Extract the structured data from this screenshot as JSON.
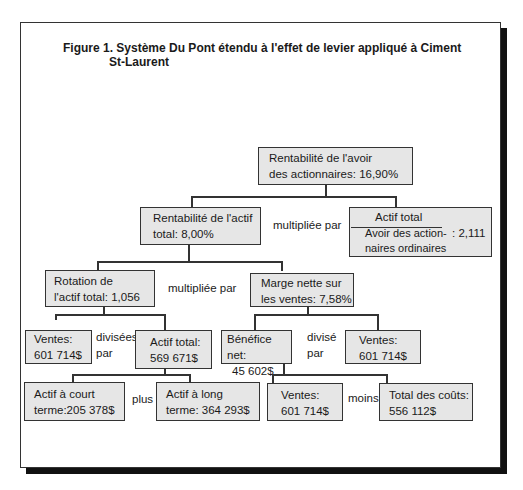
{
  "figure": {
    "title_line1": "Figure 1. Système Du Pont étendu à l'effet de levier appliqué à Ciment",
    "title_line2": "St-Laurent"
  },
  "nodes": {
    "roe": {
      "line1": "Rentabilité de l'avoir",
      "line2": "des actionnaires: 16,90%"
    },
    "roa": {
      "line1": "Rentabilité de l'actif",
      "line2": "total: 8,00%"
    },
    "leverage": {
      "numerator": "Actif total",
      "denominator_line1": "Avoir des action-",
      "denominator_line2": "naires ordinaires",
      "value": ": 2,111"
    },
    "turnover": {
      "line1": "Rotation de",
      "line2": "l'actif total: 1,056"
    },
    "margin": {
      "line1": "Marge nette sur",
      "line2": "les ventes: 7,58%"
    },
    "sales_a": {
      "line1": "Ventes:",
      "line2": "601 714$"
    },
    "total_assets": {
      "line1": "Actif total:",
      "line2": "569 671$"
    },
    "net_income": {
      "line1": "Bénéfice net:",
      "line2": "45 602$"
    },
    "sales_b": {
      "line1": "Ventes:",
      "line2": "601 714$"
    },
    "current_assets": {
      "line1": "Actif à court",
      "line2": "terme:205 378$"
    },
    "longterm_assets": {
      "line1": "Actif à long",
      "line2": "terme: 364 293$"
    },
    "sales_c": {
      "line1": "Ventes:",
      "line2": "601 714$"
    },
    "total_costs": {
      "line1": "Total des coûts:",
      "line2": "556 112$"
    }
  },
  "operators": {
    "roa_x_leverage": "multipliée par",
    "turnover_x_margin": "multipliée par",
    "sales_div_assets_1": "divisées",
    "sales_div_assets_2": "par",
    "income_div_sales_1": "divisé",
    "income_div_sales_2": "par",
    "current_plus_long": "plus",
    "sales_minus_costs": "moins"
  }
}
